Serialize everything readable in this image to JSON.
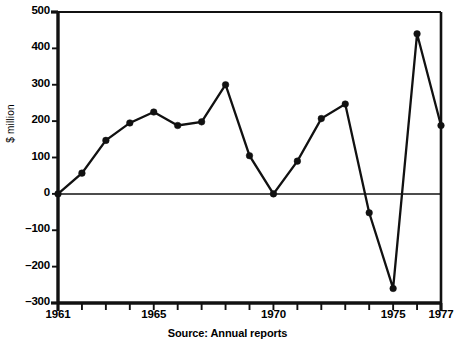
{
  "chart_data": {
    "type": "line",
    "title": "",
    "subtitle": "",
    "xlabel": "",
    "ylabel": "$ million",
    "source_note": "Source: Annual reports",
    "x": [
      1961,
      1962,
      1963,
      1964,
      1965,
      1966,
      1967,
      1968,
      1969,
      1970,
      1971,
      1972,
      1973,
      1974,
      1975,
      1976,
      1977
    ],
    "values": [
      0,
      57,
      147,
      195,
      225,
      188,
      198,
      300,
      105,
      0,
      90,
      207,
      247,
      -52,
      -260,
      440,
      188
    ],
    "series": [
      {
        "name": "",
        "values": [
          0,
          57,
          147,
          195,
          225,
          188,
          198,
          300,
          105,
          0,
          90,
          207,
          247,
          -52,
          -260,
          440,
          188
        ]
      }
    ],
    "xlim": [
      1961,
      1977
    ],
    "ylim": [
      -300,
      500
    ],
    "ytick_values": [
      500,
      400,
      300,
      200,
      100,
      0,
      -100,
      -200,
      -300
    ],
    "ytick_labels": [
      "500",
      "400",
      "300",
      "200",
      "100",
      "0",
      "–100",
      "–200",
      "–300"
    ],
    "xtick_values": [
      1961,
      1962,
      1963,
      1964,
      1965,
      1966,
      1967,
      1968,
      1969,
      1970,
      1971,
      1972,
      1973,
      1974,
      1975,
      1976,
      1977
    ],
    "xtick_labels": [
      {
        "value": 1961,
        "label": "1961"
      },
      {
        "value": 1965,
        "label": "1965"
      },
      {
        "value": 1970,
        "label": "1970"
      },
      {
        "value": 1975,
        "label": "1975"
      },
      {
        "value": 1977,
        "label": "1977"
      }
    ],
    "grid": false,
    "legend": "none",
    "marker": "filled-circle",
    "line_color": "#111111",
    "marker_color": "#111111",
    "axis_color": "#111111",
    "background_color": "#ffffff",
    "zero_line": true
  }
}
